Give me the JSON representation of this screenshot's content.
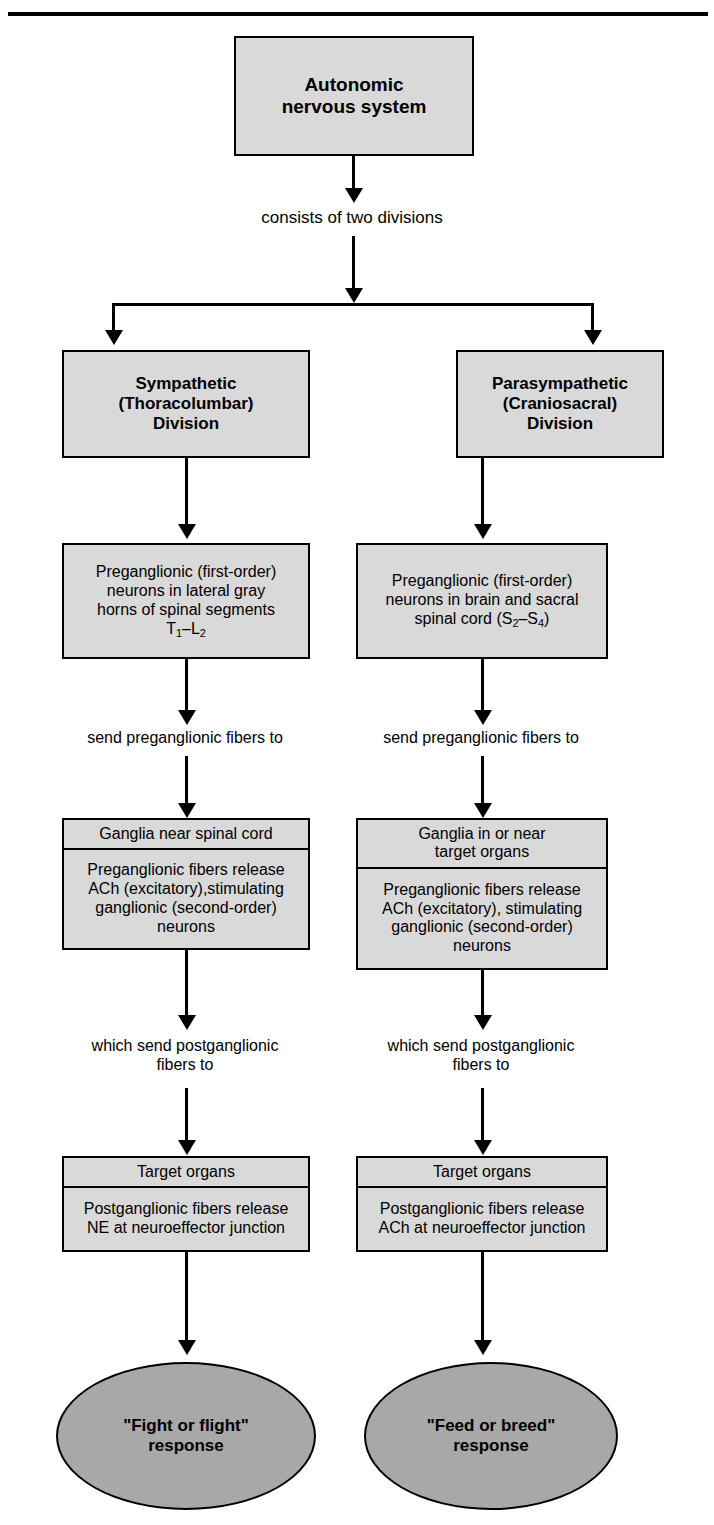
{
  "diagram": {
    "colors": {
      "box_fill": "#d9d9d9",
      "box_shadow": "#a6a6a6",
      "ellipse_fill": "#a8a8a8",
      "stroke": "#000000",
      "background": "#ffffff"
    },
    "root": {
      "label": "Autonomic\nnervous system",
      "line1": "Autonomic",
      "line2": "nervous system"
    },
    "connector_root": "consists of two divisions",
    "columns": [
      {
        "id": "sympathetic",
        "division": {
          "line1": "Sympathetic",
          "line2": "(Thoracolumbar)",
          "line3": "Division"
        },
        "preganglionic": {
          "line1": "Preganglionic (first-order)",
          "line2": "neurons in lateral gray",
          "line3": "horns of spinal segments",
          "line4_pre": "T",
          "line4_sub1": "1",
          "line4_mid": "–L",
          "line4_sub2": "2"
        },
        "connector1": "send preganglionic fibers to",
        "ganglia": {
          "strip_line1": "Ganglia near spinal cord",
          "strip_line2": "",
          "body_line1": "Preganglionic fibers release",
          "body_line2": "ACh (excitatory),stimulating",
          "body_line3": "ganglionic (second-order)",
          "body_line4": "neurons"
        },
        "connector2_line1": "which send postganglionic",
        "connector2_line2": "fibers to",
        "target": {
          "strip": "Target organs",
          "body_line1": "Postganglionic fibers release",
          "body_line2": "NE at neuroeffector junction"
        },
        "outcome": {
          "line1": "\"Fight or flight\"",
          "line2": "response"
        }
      },
      {
        "id": "parasympathetic",
        "division": {
          "line1": "Parasympathetic",
          "line2": "(Craniosacral)",
          "line3": "Division"
        },
        "preganglionic": {
          "line1": "Preganglionic (first-order)",
          "line2": "neurons in brain and sacral",
          "line3_pre": "spinal cord (S",
          "line3_sub1": "2",
          "line3_mid": "–S",
          "line3_sub2": "4",
          "line3_post": ")",
          "line4_pre": "",
          "line4_sub1": "",
          "line4_mid": "",
          "line4_sub2": ""
        },
        "connector1": "send preganglionic fibers to",
        "ganglia": {
          "strip_line1": "Ganglia in or near",
          "strip_line2": "target organs",
          "body_line1": "Preganglionic fibers release",
          "body_line2": "ACh (excitatory), stimulating",
          "body_line3": "ganglionic (second-order)",
          "body_line4": "neurons"
        },
        "connector2_line1": "which send postganglionic",
        "connector2_line2": "fibers to",
        "target": {
          "strip": "Target organs",
          "body_line1": "Postganglionic fibers release",
          "body_line2": "ACh at neuroeffector junction"
        },
        "outcome": {
          "line1": "\"Feed or breed\"",
          "line2": "response"
        }
      }
    ]
  }
}
